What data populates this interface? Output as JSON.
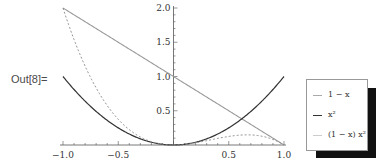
{
  "cell": {
    "out_label": "Out[8]="
  },
  "chart_data": {
    "type": "line",
    "title": "",
    "xlabel": "",
    "ylabel": "",
    "xlim": [
      -1.0,
      1.0
    ],
    "ylim": [
      0,
      2.0
    ],
    "x_ticks": [
      "-1.0",
      "-0.5",
      "0.5",
      "1.0"
    ],
    "y_ticks": [
      "0.5",
      "1.0",
      "1.5",
      "2.0"
    ],
    "grid": false,
    "legend_position": "right",
    "x": [
      -1.0,
      -0.75,
      -0.5,
      -0.25,
      0,
      0.25,
      0.5,
      0.75,
      1.0
    ],
    "series": [
      {
        "name": "1 - x",
        "style": "solid light gray",
        "color": "#999999",
        "values": [
          2.0,
          1.75,
          1.5,
          1.25,
          1.0,
          0.75,
          0.5,
          0.25,
          0.0
        ]
      },
      {
        "name": "x^2",
        "style": "solid dark",
        "color": "#333333",
        "values": [
          1.0,
          0.5625,
          0.25,
          0.0625,
          0.0,
          0.0625,
          0.25,
          0.5625,
          1.0
        ]
      },
      {
        "name": "(1 - x) x^2",
        "style": "dashed",
        "color": "#888888",
        "values": [
          2.0,
          0.984,
          0.375,
          0.078,
          0.0,
          0.047,
          0.125,
          0.141,
          0.0
        ]
      }
    ]
  },
  "legend": {
    "items": [
      {
        "label": "1 − x",
        "color": "#aaaaaa"
      },
      {
        "label": "x²",
        "color": "#333333"
      },
      {
        "label": "(1 − x) x²",
        "color": "#bbbbbb"
      }
    ]
  }
}
